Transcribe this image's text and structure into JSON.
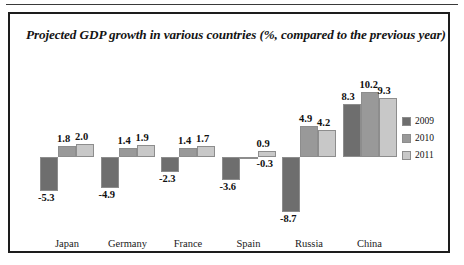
{
  "chart_data": {
    "type": "bar",
    "title": "Projected GDP growth in various countries (%, compared to the previous year)",
    "xlabel": "",
    "ylabel": "",
    "categories": [
      "Japan",
      "Germany",
      "France",
      "Spain",
      "Russia",
      "China"
    ],
    "series": [
      {
        "name": "2009",
        "color": "#6e6e6e",
        "values": [
          -5.3,
          -4.9,
          -2.3,
          -3.6,
          -8.7,
          8.3
        ]
      },
      {
        "name": "2010",
        "color": "#999999",
        "values": [
          1.8,
          1.4,
          1.4,
          -0.3,
          4.9,
          10.2
        ]
      },
      {
        "name": "2011",
        "color": "#c8c8c8",
        "values": [
          2.0,
          1.9,
          1.7,
          0.9,
          4.2,
          9.3
        ]
      }
    ],
    "value_labels": [
      [
        "-5.3",
        "1.8",
        "2.0"
      ],
      [
        "-4.9",
        "1.4",
        "1.9"
      ],
      [
        "-2.3",
        "1.4",
        "1.7"
      ],
      [
        "-3.6",
        "-0.3",
        "0.9"
      ],
      [
        "-8.7",
        "4.9",
        "4.2"
      ],
      [
        "8.3",
        "10.2",
        "9.3"
      ]
    ],
    "ylim": [
      -10.5,
      11.5
    ],
    "grid": false,
    "legend_position": "right"
  },
  "legend": {
    "items": [
      {
        "label": "2009"
      },
      {
        "label": "2010"
      },
      {
        "label": "2011"
      }
    ]
  },
  "colors": {
    "series_2009": "#6e6e6e",
    "series_2010": "#999999",
    "series_2011": "#c8c8c8",
    "frame": "#1d1d1d",
    "text": "#101010",
    "background": "#ffffff"
  }
}
